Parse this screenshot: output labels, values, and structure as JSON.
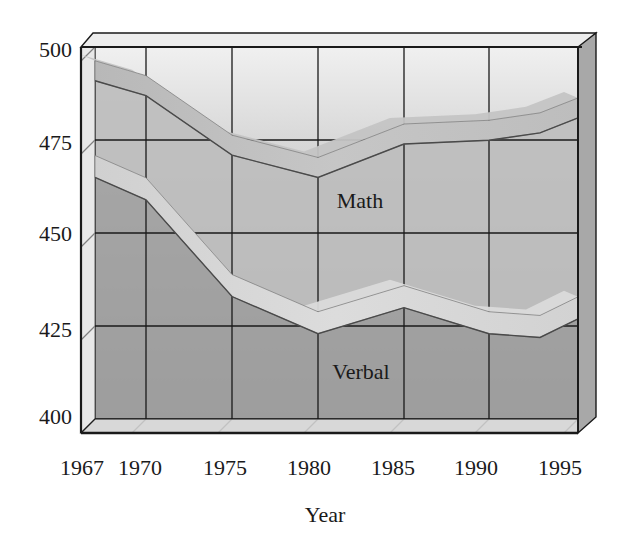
{
  "chart_data": {
    "type": "line",
    "title": "",
    "xlabel": "Year",
    "ylabel": "",
    "x": [
      1967,
      1970,
      1975,
      1980,
      1985,
      1990,
      1993,
      1995
    ],
    "x_tick_labels": [
      "1967",
      "1970",
      "1975",
      "1980",
      "1985",
      "1990",
      "1995"
    ],
    "y_tick_labels": [
      "500",
      "475",
      "450",
      "425",
      "400"
    ],
    "ylim": [
      400,
      500
    ],
    "grid": true,
    "style": "3d-ribbon",
    "series": [
      {
        "name": "Math",
        "values": [
          492,
          488,
          472,
          466,
          475,
          476,
          478,
          482
        ]
      },
      {
        "name": "Verbal",
        "values": [
          466,
          460,
          434,
          424,
          431,
          424,
          423,
          428
        ]
      }
    ],
    "annotations": [
      {
        "text": "Math",
        "near_year": 1982,
        "near_value": 459
      },
      {
        "text": "Verbal",
        "near_year": 1982,
        "near_value": 413
      }
    ],
    "legend": "inline labels"
  },
  "axis": {
    "y_labels": [
      "500",
      "475",
      "450",
      "425",
      "400"
    ],
    "x_labels": [
      "1967",
      "1970",
      "1975",
      "1980",
      "1985",
      "1990",
      "1995"
    ],
    "x_title": "Year"
  },
  "labels": {
    "math": "Math",
    "verbal": "Verbal"
  },
  "colors": {
    "wall_top": "#ececec",
    "wall_bottom": "#9a9a9a",
    "frame": "#1a1a1a",
    "ribbon_top": "#c8c8c8",
    "ribbon_face": "#b0b0b0",
    "ribbon_light": "#d8d8d8",
    "under_area": "#9c9c9c"
  }
}
